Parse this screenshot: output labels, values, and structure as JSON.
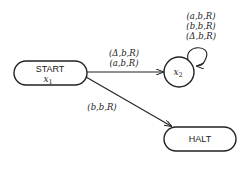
{
  "diagram": {
    "type": "turing-machine-state-diagram",
    "nodes": [
      {
        "id": "start",
        "label": "START",
        "var": "x",
        "sub": "1",
        "shape": "rounded-rect"
      },
      {
        "id": "x2",
        "label": "",
        "var": "x",
        "sub": "2",
        "shape": "circle"
      },
      {
        "id": "halt",
        "label": "HALT",
        "shape": "rounded-rect"
      }
    ],
    "edges": [
      {
        "from": "start",
        "to": "x2",
        "labels": [
          "(Δ,b,R)",
          "(a,b,R)"
        ]
      },
      {
        "from": "x2",
        "to": "x2",
        "labels": [
          "(a,b,R)",
          "(b,b,R)",
          "(Δ,b,R)"
        ]
      },
      {
        "from": "start",
        "to": "halt",
        "labels": [
          "(b,b,R)"
        ]
      }
    ]
  }
}
